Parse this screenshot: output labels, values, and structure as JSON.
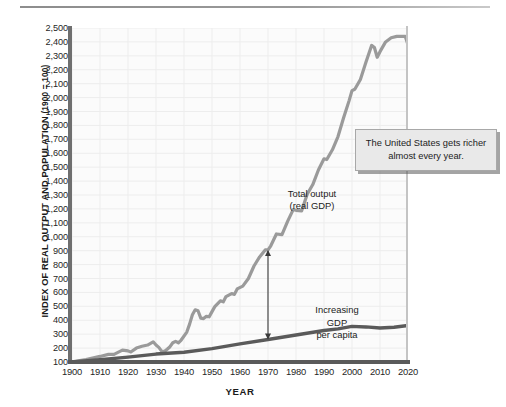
{
  "chart_data": {
    "type": "line",
    "title": "",
    "xlabel": "YEAR",
    "ylabel": "INDEX OF REAL OUTPUT AND POPULATION (1900 = 100)",
    "ylabel_main": "INDEX OF REAL OUTPUT AND POPULATION",
    "ylabel_paren": "(1900 = 100)",
    "xlim": [
      1900,
      2020
    ],
    "ylim": [
      100,
      2500
    ],
    "grid": true,
    "legend_position": "inline-labels",
    "y_ticks": [
      100,
      200,
      300,
      400,
      500,
      600,
      700,
      800,
      900,
      1000,
      1100,
      1200,
      1300,
      1400,
      1500,
      1600,
      1700,
      1800,
      1900,
      2000,
      2100,
      2200,
      2300,
      2400,
      2500
    ],
    "y_tick_labels": [
      "100",
      "200",
      "300",
      "400",
      "500",
      "600",
      "700",
      "800",
      "900",
      "1,000",
      "1,100",
      "1,200",
      "1,300",
      "1,400",
      "1,500",
      "1,600",
      "1,700",
      "1,800",
      "1,900",
      "2,000",
      "2,100",
      "2,200",
      "2,300",
      "2,400",
      "2,500"
    ],
    "x_ticks": [
      1900,
      1910,
      1920,
      1930,
      1940,
      1950,
      1960,
      1970,
      1980,
      1990,
      2000,
      2010,
      2020
    ],
    "x_tick_labels": [
      "1900",
      "1910",
      "1920",
      "1930",
      "1940",
      "1950",
      "1960",
      "1970",
      "1980",
      "1990",
      "2000",
      "2010",
      "2020"
    ],
    "series": [
      {
        "name": "Total output (real GDP)",
        "label_line1": "Total output",
        "label_line2": "(real GDP)",
        "color": "#9a9a9a",
        "x": [
          1900,
          1905,
          1910,
          1913,
          1915,
          1918,
          1920,
          1921,
          1923,
          1925,
          1927,
          1929,
          1930,
          1931,
          1932,
          1933,
          1934,
          1935,
          1936,
          1937,
          1938,
          1939,
          1941,
          1942,
          1943,
          1944,
          1945,
          1946,
          1947,
          1948,
          1949,
          1950,
          1951,
          1953,
          1954,
          1955,
          1957,
          1958,
          1959,
          1961,
          1963,
          1965,
          1967,
          1969,
          1970,
          1971,
          1973,
          1975,
          1977,
          1979,
          1980,
          1982,
          1984,
          1986,
          1988,
          1990,
          1991,
          1993,
          1995,
          1997,
          1999,
          2000,
          2001,
          2003,
          2005,
          2007,
          2008,
          2009,
          2010,
          2012,
          2014,
          2016,
          2018,
          2019,
          2020
        ],
        "y": [
          100,
          118,
          140,
          155,
          155,
          185,
          180,
          172,
          200,
          213,
          222,
          245,
          222,
          205,
          178,
          175,
          192,
          210,
          238,
          248,
          238,
          258,
          315,
          372,
          440,
          475,
          468,
          415,
          412,
          428,
          425,
          462,
          498,
          540,
          532,
          570,
          592,
          586,
          625,
          645,
          700,
          790,
          855,
          905,
          905,
          935,
          1020,
          1015,
          1110,
          1195,
          1190,
          1185,
          1305,
          1375,
          1480,
          1560,
          1555,
          1625,
          1720,
          1855,
          1980,
          2050,
          2060,
          2130,
          2255,
          2375,
          2360,
          2290,
          2330,
          2400,
          2430,
          2440,
          2440,
          2440,
          2380
        ]
      },
      {
        "name": "Population",
        "label": "Population",
        "color": "#5a5a5a",
        "x": [
          1900,
          1910,
          1920,
          1930,
          1940,
          1950,
          1960,
          1970,
          1980,
          1990,
          1995,
          2000,
          2005,
          2010,
          2015,
          2020
        ],
        "y": [
          100,
          116,
          135,
          157,
          170,
          196,
          230,
          262,
          294,
          326,
          338,
          356,
          352,
          344,
          350,
          362
        ]
      }
    ],
    "annotations": [
      {
        "name": "increasing-gdp-per-capita",
        "line1": "Increasing",
        "line2": "GDP",
        "line3": "per capita",
        "arrow": "double-headed-vertical",
        "at_year": 1970
      },
      {
        "name": "callout-united-states",
        "text": "The United States gets richer almost every year."
      }
    ]
  },
  "axes": {
    "y_title_main": "INDEX OF REAL OUTPUT AND POPULATION",
    "y_title_paren": "(1900 = 100)",
    "x_title": "YEAR"
  },
  "labels": {
    "total_output_line1": "Total output",
    "total_output_line2": "(real GDP)",
    "population": "Population",
    "gdp_per_capita_line1": "Increasing",
    "gdp_per_capita_line2": "GDP",
    "gdp_per_capita_line3": "per capita"
  },
  "callout": {
    "text": "The United States gets richer almost every year."
  },
  "colors": {
    "gdp_line": "#9a9a9a",
    "population_line": "#5a5a5a",
    "plot_background": "#fbfbfb",
    "grid": "#ededed",
    "callout_background": "#e9e9e9",
    "axis": "#6f6f6f"
  }
}
